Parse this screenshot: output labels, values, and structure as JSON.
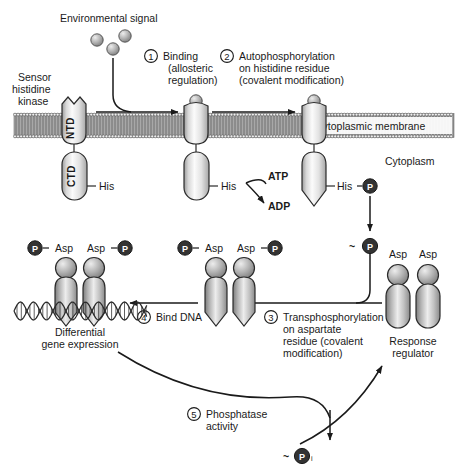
{
  "figure": {
    "type": "biological-pathway-diagram"
  },
  "labels": {
    "environmental_signal": "Environmental signal",
    "sensor_histidine_kinase": [
      "Sensor",
      "histidine",
      "kinase"
    ],
    "ntd": "NTD",
    "ctd": "CTD",
    "his": "His",
    "atp": "ATP",
    "adp": "ADP",
    "cytoplasmic_membrane": "Cytoplasmic membrane",
    "cytoplasm": "Cytoplasm",
    "asp": "Asp",
    "response_regulator": [
      "Response",
      "regulator"
    ],
    "differential_gene_expression": [
      "Differential",
      "gene expression"
    ],
    "phosphate_group": "P",
    "tilde_phosphate": "~",
    "pi_subscript": "i"
  },
  "steps": [
    {
      "number": "1",
      "lines": [
        "Binding",
        "(allosteric",
        "regulation)"
      ]
    },
    {
      "number": "2",
      "lines": [
        "Autophosphorylation",
        "on histidine residue",
        "(covalent modification)"
      ]
    },
    {
      "number": "3",
      "lines": [
        "Transphosphorylation",
        "on aspartate",
        "residue (covalent",
        "modification)"
      ]
    },
    {
      "number": "4",
      "lines": [
        "Bind DNA"
      ]
    },
    {
      "number": "5",
      "lines": [
        "Phosphatase",
        "activity"
      ]
    }
  ],
  "colors": {
    "stroke": "#1a1a1a",
    "protein_light": "#f2f2f2",
    "protein_mid": "#b9b9b9",
    "protein_dark": "#8f8f8f",
    "membrane_fill": "#9c9c9c",
    "signal_ball": "#b0b0b0",
    "phosphate_fill": "#3a3a3a",
    "background": "#ffffff"
  }
}
